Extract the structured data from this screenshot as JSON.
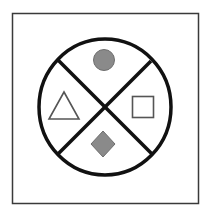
{
  "diagram": {
    "colors": {
      "background": "#ffffff",
      "frame": "#3a3a3a",
      "circle_stroke": "#111111",
      "filled_shape": "#8a8a8a",
      "outline_shape": "#555555"
    },
    "quadrants": [
      {
        "position": "top",
        "shape": "circle",
        "fill": "filled-gray"
      },
      {
        "position": "right",
        "shape": "square",
        "fill": "outline"
      },
      {
        "position": "bottom",
        "shape": "diamond",
        "fill": "filled-gray"
      },
      {
        "position": "left",
        "shape": "triangle",
        "fill": "outline"
      }
    ]
  }
}
